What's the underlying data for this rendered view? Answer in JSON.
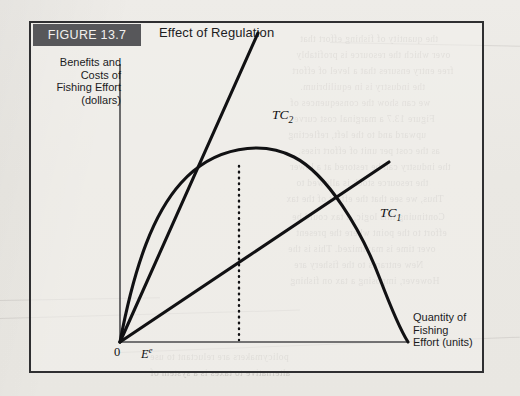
{
  "figure": {
    "tag": "FIGURE 13.7",
    "title": "Effect of Regulation"
  },
  "axes": {
    "y_caption": "Benefits and\nCosts of\nFishing Effort\n(dollars)",
    "x_caption": "Quantity of\nFishing\nEffort (units)",
    "origin_label": "0",
    "equilibrium_label": "E",
    "equilibrium_superscript": "e"
  },
  "curves": {
    "tc2_label": "TC",
    "tc2_subscript": "2",
    "tc1_label": "TC",
    "tc1_subscript": "1"
  },
  "colors": {
    "ink": "#111113",
    "frame": "#2f2f31",
    "tag_background": "#57575a",
    "tag_text": "#f2f1ef",
    "paper": "#eceae6"
  },
  "background_text": [
    "the quantity of fishing effort that",
    "over which the resource is profitably",
    "free entry ensures that a level of effort",
    "the industry is in equilibrium.",
    "we can show the consequences of",
    "Figure 13.7 a marginal cost curve",
    "upward and to the left, reflecting",
    "as the cost per unit of effort rises.",
    "the industry can be restored at a lower",
    "the resource stock is allowed to",
    "Thus, we see that the effect of the tax",
    "Continuing this logic, a tax could be",
    "effort to the point where the present",
    "over time is maximized. This is the",
    "New entrants to the fishery are",
    "However, imposing a tax on fishing",
    "policymakers are reluctant to use",
    "alternative to taxes is a system of"
  ],
  "chart_data": {
    "type": "line",
    "title": "Effect of Regulation",
    "xlabel": "Quantity of Fishing Effort (units)",
    "ylabel": "Benefits and Costs of Fishing Effort (dollars)",
    "xlim": [
      0,
      1
    ],
    "ylim": [
      0,
      1
    ],
    "grid": false,
    "legend": "inline-curve-labels",
    "series": [
      {
        "name": "Total Benefit (sustainable yield revenue)",
        "type": "parabola",
        "label": null,
        "description": "Concave total revenue curve rising from origin, peaking, and returning to the horizontal axis",
        "points": [
          {
            "x": 0.0,
            "y": 0.0
          },
          {
            "x": 0.05,
            "y": 0.19
          },
          {
            "x": 0.11,
            "y": 0.34
          },
          {
            "x": 0.18,
            "y": 0.48
          },
          {
            "x": 0.26,
            "y": 0.6
          },
          {
            "x": 0.35,
            "y": 0.69
          },
          {
            "x": 0.42,
            "y": 0.74
          },
          {
            "x": 0.53,
            "y": 0.78
          },
          {
            "x": 0.6,
            "y": 0.785
          },
          {
            "x": 0.68,
            "y": 0.76
          },
          {
            "x": 0.76,
            "y": 0.7
          },
          {
            "x": 0.84,
            "y": 0.6
          },
          {
            "x": 0.91,
            "y": 0.45
          },
          {
            "x": 0.96,
            "y": 0.28
          },
          {
            "x": 1.0,
            "y": 0.0
          }
        ]
      },
      {
        "name": "TC2",
        "type": "ray",
        "label": "TC₂",
        "description": "Steeper total cost ray from origin after regulation; intersects the benefit curve at E-superscript-e",
        "points": [
          {
            "x": 0.0,
            "y": 0.0
          },
          {
            "x": 0.48,
            "y": 0.935
          }
        ],
        "slope": 1.948
      },
      {
        "name": "TC1",
        "type": "ray",
        "label": "TC₁",
        "description": "Flatter total cost ray from origin before regulation; intersects the benefit curve at open-access equilibrium",
        "points": [
          {
            "x": 0.0,
            "y": 0.0
          },
          {
            "x": 0.935,
            "y": 0.625
          }
        ],
        "slope": 0.668
      }
    ],
    "annotations": [
      {
        "name": "equilibrium-dropline",
        "type": "vertical-dotted-line",
        "x": 0.415,
        "y_from": 0.0,
        "y_to": 0.7,
        "label": "Eᵉ"
      },
      {
        "name": "origin",
        "type": "point-label",
        "x": 0.0,
        "y": 0.0,
        "label": "0"
      }
    ]
  }
}
